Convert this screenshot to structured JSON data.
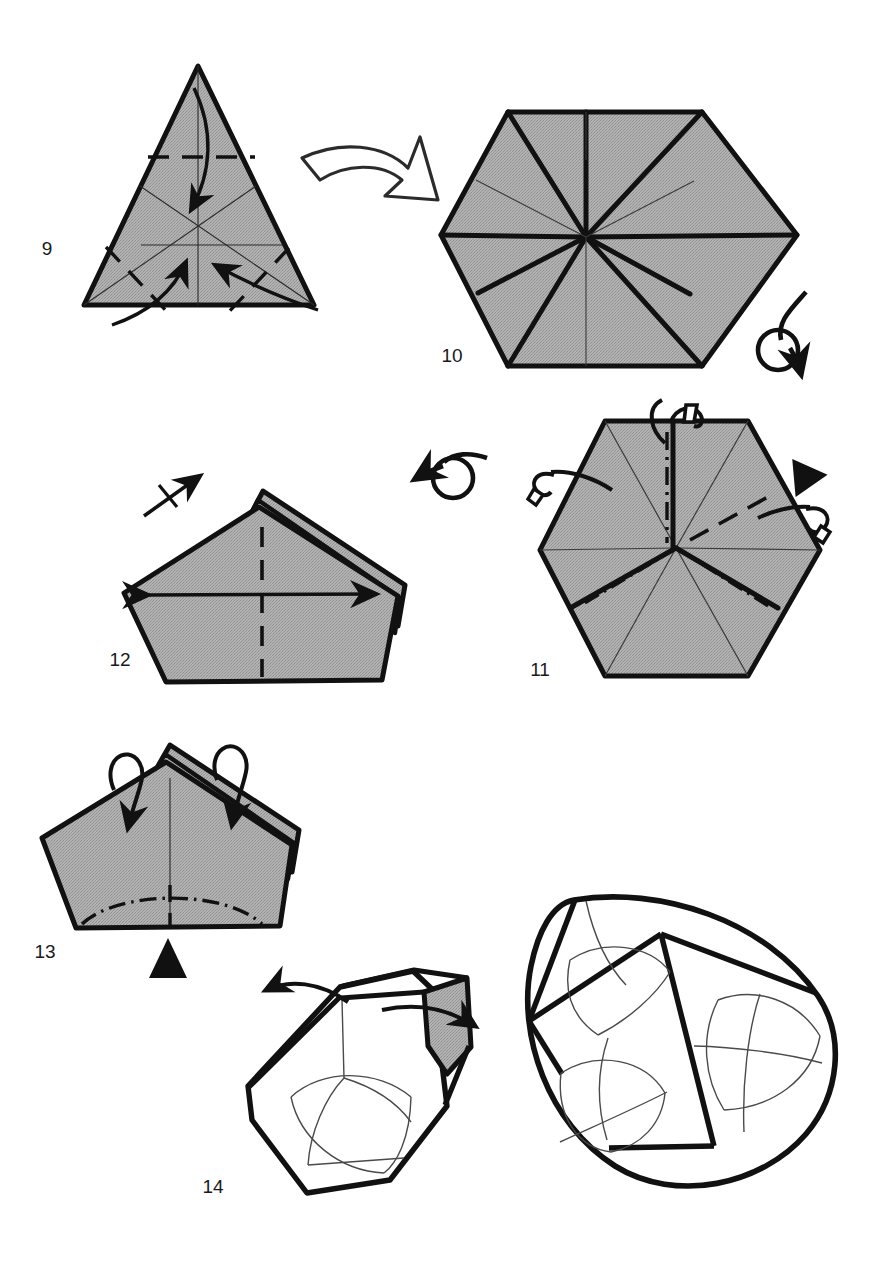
{
  "document": {
    "type": "origami-folding-diagram",
    "title": "Origami instruction steps 9 through 14",
    "background_color": "#ffffff",
    "paper_fill_color": "#a9a9a9",
    "line_color": "#111111",
    "page_width": 880,
    "page_height": 1283
  },
  "steps": [
    {
      "number": "9",
      "label_x": 47,
      "label_y": 255,
      "shape": "triangle",
      "description": "Equilateral triangle with creases, valley fold dashes and three curved arrows folding corners to center",
      "symbols": [
        "curved-fold-arrow-down",
        "curved-fold-arrow-up-left",
        "curved-fold-arrow-up-right",
        "valley-fold-dashed-line"
      ]
    },
    {
      "number": "10",
      "label_x": 452,
      "label_y": 362,
      "shape": "hexagon",
      "description": "Hexagon with radial crease lines from center, heavy edge folds",
      "symbols": [
        "turn-over-arrow"
      ]
    },
    {
      "number": "11",
      "label_x": 540,
      "label_y": 676,
      "shape": "hexagon",
      "description": "Hexagon with mountain-fold dash-dot lines, dashed valley folds, small flap tabs and a black push triangle",
      "symbols": [
        "mountain-fold-dash-dot-line",
        "valley-fold-dashed-line",
        "flap-tab",
        "black-push-triangle",
        "turn-over-arrow"
      ]
    },
    {
      "number": "12",
      "label_x": 120,
      "label_y": 666,
      "shape": "pentagon",
      "description": "Pentagon-like folded form with layered right edge, a double-headed horizontal arrow and a centre vertical dashed fold line",
      "symbols": [
        "double-headed-arrow",
        "valley-fold-dashed-line",
        "repeat-arrow-one-tick"
      ]
    },
    {
      "number": "13",
      "label_x": 45,
      "label_y": 958,
      "shape": "pentagon",
      "description": "Pentagon form with two loop-over arrows folding flaps down, dash-dot curved mountain line along the base and a black push triangle below",
      "symbols": [
        "loop-over-arrow",
        "mountain-fold-dash-dot-curve",
        "black-push-triangle",
        "valley-fold-dashed-line"
      ]
    },
    {
      "number": "14",
      "label_x": 213,
      "label_y": 1193,
      "shape": "three-dimensional-cup",
      "description": "Three dimensional cup shape opening out, with curved arrows spreading the sides, next to the completed rounded model",
      "symbols": [
        "open-out-arrow-left",
        "open-out-arrow-right"
      ]
    }
  ],
  "symbols_legend": {
    "valley_fold": "dashed line",
    "mountain_fold": "dash-dot line",
    "turn_over": "looped arrow",
    "push_here": "solid black triangle",
    "repeat": "arrow with tick marks"
  }
}
